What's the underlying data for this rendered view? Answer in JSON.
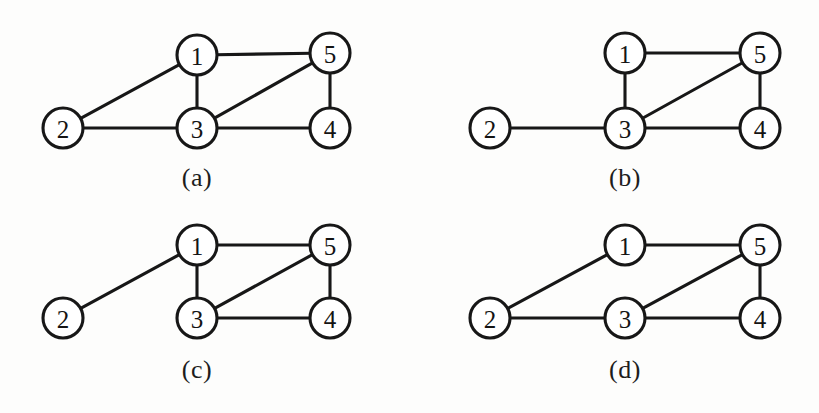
{
  "figure": {
    "background_color": "#fdfdfc",
    "ink_color": "#171717",
    "node_fill": "#ffffff",
    "node_radius": 20
  },
  "panels": [
    {
      "id": "panel-a",
      "caption": "(a)",
      "caption_x": 197,
      "caption_y": 165,
      "nodes": [
        {
          "label": "1",
          "x": 197,
          "y": 55
        },
        {
          "label": "2",
          "x": 63,
          "y": 128
        },
        {
          "label": "3",
          "x": 197,
          "y": 128
        },
        {
          "label": "4",
          "x": 330,
          "y": 128
        },
        {
          "label": "5",
          "x": 330,
          "y": 53
        }
      ],
      "edges": [
        {
          "from": "1",
          "to": "5"
        },
        {
          "from": "1",
          "to": "3"
        },
        {
          "from": "1",
          "to": "2"
        },
        {
          "from": "2",
          "to": "3"
        },
        {
          "from": "3",
          "to": "5"
        },
        {
          "from": "3",
          "to": "4"
        },
        {
          "from": "5",
          "to": "4"
        }
      ]
    },
    {
      "id": "panel-b",
      "caption": "(b)",
      "caption_x": 625,
      "caption_y": 165,
      "nodes": [
        {
          "label": "1",
          "x": 625,
          "y": 53
        },
        {
          "label": "2",
          "x": 490,
          "y": 128
        },
        {
          "label": "3",
          "x": 625,
          "y": 128
        },
        {
          "label": "4",
          "x": 760,
          "y": 128
        },
        {
          "label": "5",
          "x": 760,
          "y": 53
        }
      ],
      "edges": [
        {
          "from": "1",
          "to": "5"
        },
        {
          "from": "1",
          "to": "3"
        },
        {
          "from": "2",
          "to": "3"
        },
        {
          "from": "3",
          "to": "5"
        },
        {
          "from": "3",
          "to": "4"
        },
        {
          "from": "5",
          "to": "4"
        }
      ]
    },
    {
      "id": "panel-c",
      "caption": "(c)",
      "caption_x": 197,
      "caption_y": 357,
      "nodes": [
        {
          "label": "1",
          "x": 197,
          "y": 245
        },
        {
          "label": "2",
          "x": 63,
          "y": 318
        },
        {
          "label": "3",
          "x": 197,
          "y": 318
        },
        {
          "label": "4",
          "x": 330,
          "y": 318
        },
        {
          "label": "5",
          "x": 330,
          "y": 245
        }
      ],
      "edges": [
        {
          "from": "1",
          "to": "2"
        },
        {
          "from": "1",
          "to": "5"
        },
        {
          "from": "1",
          "to": "3"
        },
        {
          "from": "3",
          "to": "5"
        },
        {
          "from": "3",
          "to": "4"
        },
        {
          "from": "5",
          "to": "4"
        }
      ]
    },
    {
      "id": "panel-d",
      "caption": "(d)",
      "caption_x": 625,
      "caption_y": 357,
      "nodes": [
        {
          "label": "1",
          "x": 625,
          "y": 245
        },
        {
          "label": "2",
          "x": 490,
          "y": 318
        },
        {
          "label": "3",
          "x": 625,
          "y": 318
        },
        {
          "label": "4",
          "x": 760,
          "y": 318
        },
        {
          "label": "5",
          "x": 760,
          "y": 245
        }
      ],
      "edges": [
        {
          "from": "1",
          "to": "2"
        },
        {
          "from": "1",
          "to": "5"
        },
        {
          "from": "2",
          "to": "3"
        },
        {
          "from": "3",
          "to": "5"
        },
        {
          "from": "3",
          "to": "4"
        },
        {
          "from": "5",
          "to": "4"
        }
      ]
    }
  ]
}
